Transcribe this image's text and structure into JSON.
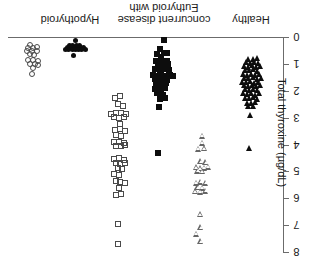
{
  "chart_data": {
    "type": "scatter",
    "title": "",
    "subtitle": "",
    "xlabel": "",
    "ylabel": "Total thyroxine (µg/dL)",
    "ylim": [
      0,
      8
    ],
    "y_ticks": [
      0,
      1,
      2,
      3,
      4,
      5,
      6,
      7,
      8
    ],
    "y_tick_labels": [
      "0",
      "1",
      "2",
      "3",
      "4",
      "5",
      "6",
      "7",
      "8"
    ],
    "y_axis_position": "right",
    "y_axis_direction": "top-to-bottom",
    "grid": false,
    "legend": "none",
    "orientation_note": "category labels and tick labels rendered rotated 180 degrees",
    "categories": [
      "Hypothyroid",
      "Euthyroid with concurrent disease",
      "Healthy"
    ],
    "category_labels": [
      {
        "line1": "Hypothyroid",
        "line2": ""
      },
      {
        "line1": "Euthyroid with",
        "line2": "concurrent disease"
      },
      {
        "line1": "Healthy",
        "line2": ""
      }
    ],
    "series": [
      {
        "name": "Hypothyroid (open circles)",
        "group": "Hypothyroid",
        "marker": "circle-open",
        "color": "#4a4a4a",
        "n": 17,
        "points": [
          {
            "x": 0.4,
            "y": 0.28
          },
          {
            "x": 0.34,
            "y": 0.4
          },
          {
            "x": 0.46,
            "y": 0.4
          },
          {
            "x": 0.31,
            "y": 0.53
          },
          {
            "x": 0.43,
            "y": 0.53
          },
          {
            "x": 0.55,
            "y": 0.36
          },
          {
            "x": 0.55,
            "y": 0.52
          },
          {
            "x": 0.38,
            "y": 0.65
          },
          {
            "x": 0.5,
            "y": 0.66
          },
          {
            "x": 0.34,
            "y": 0.86
          },
          {
            "x": 0.46,
            "y": 0.86
          },
          {
            "x": 0.58,
            "y": 0.88
          },
          {
            "x": 0.4,
            "y": 1.0
          },
          {
            "x": 0.52,
            "y": 1.01
          },
          {
            "x": 0.46,
            "y": 1.14
          },
          {
            "x": 0.58,
            "y": 1.06
          },
          {
            "x": 0.43,
            "y": 1.36
          }
        ]
      },
      {
        "name": "Hypothyroid (filled circles)",
        "group": "Hypothyroid",
        "marker": "circle-filled",
        "color": "#0d0d0d",
        "n": 19,
        "points": [
          {
            "x": 1.5,
            "y": 0.12
          },
          {
            "x": 1.36,
            "y": 0.32
          },
          {
            "x": 1.44,
            "y": 0.32
          },
          {
            "x": 1.52,
            "y": 0.32
          },
          {
            "x": 1.6,
            "y": 0.32
          },
          {
            "x": 1.3,
            "y": 0.4
          },
          {
            "x": 1.38,
            "y": 0.4
          },
          {
            "x": 1.46,
            "y": 0.4
          },
          {
            "x": 1.54,
            "y": 0.4
          },
          {
            "x": 1.62,
            "y": 0.4
          },
          {
            "x": 1.7,
            "y": 0.4
          },
          {
            "x": 1.34,
            "y": 0.48
          },
          {
            "x": 1.42,
            "y": 0.48
          },
          {
            "x": 1.5,
            "y": 0.48
          },
          {
            "x": 1.58,
            "y": 0.48
          },
          {
            "x": 1.66,
            "y": 0.48
          },
          {
            "x": 1.74,
            "y": 0.46
          },
          {
            "x": 1.26,
            "y": 0.46
          },
          {
            "x": 1.46,
            "y": 0.7
          }
        ]
      },
      {
        "name": "Euthyroid with concurrent disease (open squares)",
        "group": "Euthyroid with concurrent disease",
        "marker": "square-open",
        "color": "#4a4a4a",
        "n": 41,
        "points": [
          {
            "x": 2.46,
            "y": 2.26
          },
          {
            "x": 2.6,
            "y": 2.18
          },
          {
            "x": 2.54,
            "y": 2.5
          },
          {
            "x": 2.66,
            "y": 2.58
          },
          {
            "x": 2.38,
            "y": 2.88
          },
          {
            "x": 2.5,
            "y": 2.84
          },
          {
            "x": 2.62,
            "y": 2.82
          },
          {
            "x": 2.74,
            "y": 2.86
          },
          {
            "x": 2.44,
            "y": 2.98
          },
          {
            "x": 2.56,
            "y": 3.02
          },
          {
            "x": 2.68,
            "y": 2.96
          },
          {
            "x": 2.58,
            "y": 3.22
          },
          {
            "x": 2.46,
            "y": 3.46
          },
          {
            "x": 2.58,
            "y": 3.44
          },
          {
            "x": 2.7,
            "y": 3.48
          },
          {
            "x": 2.5,
            "y": 3.66
          },
          {
            "x": 2.62,
            "y": 3.7
          },
          {
            "x": 2.44,
            "y": 3.92
          },
          {
            "x": 2.56,
            "y": 3.9
          },
          {
            "x": 2.68,
            "y": 3.94
          },
          {
            "x": 2.5,
            "y": 4.06
          },
          {
            "x": 2.62,
            "y": 4.04
          },
          {
            "x": 2.72,
            "y": 4.0
          },
          {
            "x": 2.44,
            "y": 4.54
          },
          {
            "x": 2.56,
            "y": 4.5
          },
          {
            "x": 2.68,
            "y": 4.56
          },
          {
            "x": 2.5,
            "y": 4.7
          },
          {
            "x": 2.6,
            "y": 4.74
          },
          {
            "x": 2.7,
            "y": 4.7
          },
          {
            "x": 2.54,
            "y": 4.88
          },
          {
            "x": 2.64,
            "y": 4.9
          },
          {
            "x": 2.44,
            "y": 5.08
          },
          {
            "x": 2.56,
            "y": 5.12
          },
          {
            "x": 2.48,
            "y": 5.34
          },
          {
            "x": 2.6,
            "y": 5.38
          },
          {
            "x": 2.7,
            "y": 5.42
          },
          {
            "x": 2.56,
            "y": 5.62
          },
          {
            "x": 2.5,
            "y": 5.88
          },
          {
            "x": 2.62,
            "y": 5.86
          },
          {
            "x": 2.54,
            "y": 6.94
          },
          {
            "x": 2.54,
            "y": 7.72
          }
        ]
      },
      {
        "name": "Euthyroid with concurrent disease (filled squares)",
        "group": "Euthyroid with concurrent disease",
        "marker": "square-filled",
        "color": "#0d0d0d",
        "n": 38,
        "points": [
          {
            "x": 3.66,
            "y": 0.1
          },
          {
            "x": 3.56,
            "y": 0.46
          },
          {
            "x": 3.5,
            "y": 0.62
          },
          {
            "x": 3.66,
            "y": 0.6
          },
          {
            "x": 3.74,
            "y": 0.58
          },
          {
            "x": 3.58,
            "y": 0.76
          },
          {
            "x": 3.46,
            "y": 0.9
          },
          {
            "x": 3.62,
            "y": 0.92
          },
          {
            "x": 3.74,
            "y": 0.88
          },
          {
            "x": 3.52,
            "y": 1.04
          },
          {
            "x": 3.66,
            "y": 1.06
          },
          {
            "x": 3.76,
            "y": 1.0
          },
          {
            "x": 3.44,
            "y": 1.2
          },
          {
            "x": 3.56,
            "y": 1.22
          },
          {
            "x": 3.68,
            "y": 1.18
          },
          {
            "x": 3.78,
            "y": 1.24
          },
          {
            "x": 3.4,
            "y": 1.4
          },
          {
            "x": 3.5,
            "y": 1.44
          },
          {
            "x": 3.6,
            "y": 1.42
          },
          {
            "x": 3.7,
            "y": 1.46
          },
          {
            "x": 3.8,
            "y": 1.4
          },
          {
            "x": 3.88,
            "y": 1.44
          },
          {
            "x": 3.44,
            "y": 1.56
          },
          {
            "x": 3.54,
            "y": 1.58
          },
          {
            "x": 3.64,
            "y": 1.54
          },
          {
            "x": 3.74,
            "y": 1.6
          },
          {
            "x": 3.48,
            "y": 1.74
          },
          {
            "x": 3.62,
            "y": 1.76
          },
          {
            "x": 3.72,
            "y": 1.72
          },
          {
            "x": 3.44,
            "y": 1.92
          },
          {
            "x": 3.58,
            "y": 1.94
          },
          {
            "x": 3.7,
            "y": 1.9
          },
          {
            "x": 3.5,
            "y": 2.1
          },
          {
            "x": 3.64,
            "y": 2.14
          },
          {
            "x": 3.56,
            "y": 2.3
          },
          {
            "x": 3.68,
            "y": 2.26
          },
          {
            "x": 3.54,
            "y": 2.62
          },
          {
            "x": 3.52,
            "y": 4.32
          }
        ]
      },
      {
        "name": "Healthy (open triangles)",
        "group": "Healthy",
        "marker": "triangle-open",
        "color": "#666666",
        "n": 24,
        "points": [
          {
            "x": 4.62,
            "y": 3.68
          },
          {
            "x": 4.62,
            "y": 3.94
          },
          {
            "x": 4.52,
            "y": 4.16
          },
          {
            "x": 4.66,
            "y": 4.14
          },
          {
            "x": 4.58,
            "y": 4.62
          },
          {
            "x": 4.7,
            "y": 4.66
          },
          {
            "x": 4.46,
            "y": 4.84
          },
          {
            "x": 4.56,
            "y": 4.88
          },
          {
            "x": 4.66,
            "y": 4.86
          },
          {
            "x": 4.76,
            "y": 4.82
          },
          {
            "x": 4.5,
            "y": 4.98
          },
          {
            "x": 4.62,
            "y": 5.0
          },
          {
            "x": 4.46,
            "y": 5.42
          },
          {
            "x": 4.58,
            "y": 5.38
          },
          {
            "x": 4.7,
            "y": 5.42
          },
          {
            "x": 4.5,
            "y": 5.58
          },
          {
            "x": 4.62,
            "y": 5.6
          },
          {
            "x": 4.44,
            "y": 5.74
          },
          {
            "x": 4.56,
            "y": 5.76
          },
          {
            "x": 4.7,
            "y": 5.72
          },
          {
            "x": 4.56,
            "y": 6.6
          },
          {
            "x": 4.58,
            "y": 7.08
          },
          {
            "x": 4.46,
            "y": 7.32
          },
          {
            "x": 4.58,
            "y": 7.6
          }
        ]
      },
      {
        "name": "Healthy (filled triangles)",
        "group": "Healthy",
        "marker": "triangle-filled",
        "color": "#0d0d0d",
        "n": 56,
        "points": [
          {
            "x": 5.74,
            "y": 0.8
          },
          {
            "x": 5.84,
            "y": 0.82
          },
          {
            "x": 5.94,
            "y": 0.78
          },
          {
            "x": 5.68,
            "y": 0.94
          },
          {
            "x": 5.78,
            "y": 0.96
          },
          {
            "x": 5.88,
            "y": 0.92
          },
          {
            "x": 5.98,
            "y": 0.96
          },
          {
            "x": 5.62,
            "y": 1.08
          },
          {
            "x": 5.72,
            "y": 1.1
          },
          {
            "x": 5.82,
            "y": 1.06
          },
          {
            "x": 5.92,
            "y": 1.12
          },
          {
            "x": 6.02,
            "y": 1.08
          },
          {
            "x": 5.66,
            "y": 1.22
          },
          {
            "x": 5.76,
            "y": 1.24
          },
          {
            "x": 5.86,
            "y": 1.2
          },
          {
            "x": 5.96,
            "y": 1.26
          },
          {
            "x": 5.6,
            "y": 1.38
          },
          {
            "x": 5.7,
            "y": 1.4
          },
          {
            "x": 5.8,
            "y": 1.36
          },
          {
            "x": 5.9,
            "y": 1.42
          },
          {
            "x": 6.0,
            "y": 1.38
          },
          {
            "x": 5.64,
            "y": 1.52
          },
          {
            "x": 5.74,
            "y": 1.54
          },
          {
            "x": 5.84,
            "y": 1.5
          },
          {
            "x": 5.94,
            "y": 1.56
          },
          {
            "x": 6.04,
            "y": 1.52
          },
          {
            "x": 5.58,
            "y": 1.66
          },
          {
            "x": 5.68,
            "y": 1.68
          },
          {
            "x": 5.78,
            "y": 1.64
          },
          {
            "x": 5.88,
            "y": 1.7
          },
          {
            "x": 5.98,
            "y": 1.66
          },
          {
            "x": 5.62,
            "y": 1.8
          },
          {
            "x": 5.72,
            "y": 1.82
          },
          {
            "x": 5.82,
            "y": 1.78
          },
          {
            "x": 5.92,
            "y": 1.84
          },
          {
            "x": 6.02,
            "y": 1.8
          },
          {
            "x": 5.66,
            "y": 1.94
          },
          {
            "x": 5.76,
            "y": 1.96
          },
          {
            "x": 5.86,
            "y": 1.92
          },
          {
            "x": 5.96,
            "y": 1.98
          },
          {
            "x": 5.6,
            "y": 2.1
          },
          {
            "x": 5.7,
            "y": 2.12
          },
          {
            "x": 5.8,
            "y": 2.08
          },
          {
            "x": 5.9,
            "y": 2.14
          },
          {
            "x": 6.0,
            "y": 2.1
          },
          {
            "x": 5.66,
            "y": 2.26
          },
          {
            "x": 5.76,
            "y": 2.28
          },
          {
            "x": 5.86,
            "y": 2.24
          },
          {
            "x": 5.96,
            "y": 2.3
          },
          {
            "x": 5.7,
            "y": 2.44
          },
          {
            "x": 5.8,
            "y": 2.46
          },
          {
            "x": 5.9,
            "y": 2.42
          },
          {
            "x": 5.74,
            "y": 2.58
          },
          {
            "x": 5.84,
            "y": 2.56
          },
          {
            "x": 5.78,
            "y": 2.92
          },
          {
            "x": 5.76,
            "y": 4.12
          }
        ]
      }
    ]
  }
}
